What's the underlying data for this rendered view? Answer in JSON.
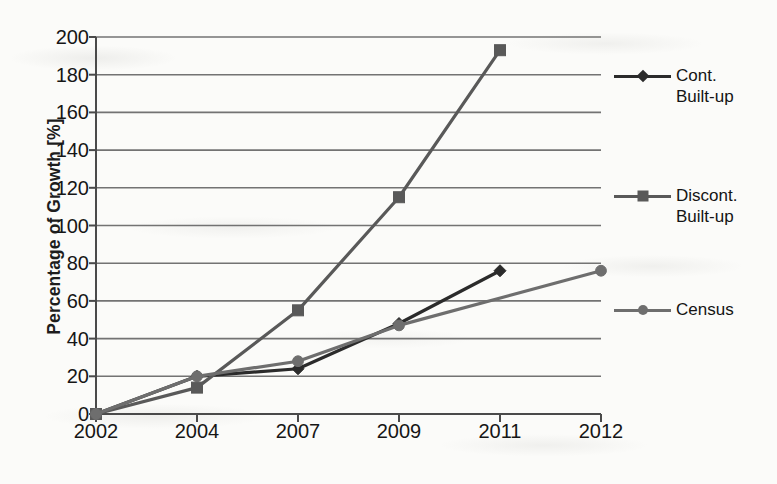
{
  "chart_data": {
    "type": "line",
    "title": "",
    "xlabel": "",
    "ylabel": "Percentage of Growth [%]",
    "categories": [
      "2002",
      "2004",
      "2007",
      "2009",
      "2011",
      "2012"
    ],
    "ylim": [
      0,
      200
    ],
    "ytick_step": 20,
    "yticks": [
      "200",
      "180",
      "160",
      "140",
      "120",
      "100",
      "80",
      "60",
      "40",
      "20",
      "0"
    ],
    "grid": "horizontal",
    "legend_position": "right",
    "series": [
      {
        "name": "Cont. Built-up",
        "legend_label": "Cont.\nBuilt-up",
        "marker": "diamond",
        "color": "#2b2b2b",
        "x": [
          "2002",
          "2004",
          "2007",
          "2009",
          "2011"
        ],
        "values": [
          0,
          20,
          24,
          48,
          76
        ]
      },
      {
        "name": "Discont. Built-up",
        "legend_label": "Discont.\nBuilt-up",
        "marker": "square",
        "color": "#595959",
        "x": [
          "2002",
          "2004",
          "2007",
          "2009",
          "2011"
        ],
        "values": [
          0,
          14,
          55,
          115,
          193
        ]
      },
      {
        "name": "Census",
        "legend_label": "Census",
        "marker": "circle",
        "color": "#6e6e6e",
        "x": [
          "2002",
          "2004",
          "2007",
          "2009",
          "2012"
        ],
        "values": [
          0,
          20,
          28,
          47,
          76
        ]
      }
    ]
  },
  "colors": {
    "axis": "#4a4a4a",
    "grid": "#5c5c5c",
    "text": "#161616",
    "background": "#fbfbf9"
  }
}
